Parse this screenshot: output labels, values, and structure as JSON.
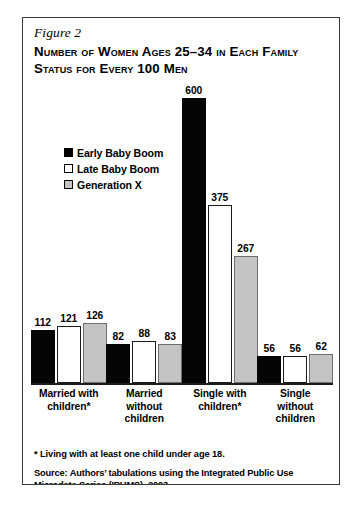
{
  "figure": {
    "label": "Figure 2",
    "title": "Number of Women Ages 25–34 in Each Family Status for Every 100 Men",
    "footnote": "* Living with at least one child under age 18.",
    "source": "Source: Authors’ tabulations using the Integrated Public Use Microdata Series (IPUMS), 2003."
  },
  "legend": {
    "items": [
      {
        "label": "Early Baby Boom",
        "swatch": "black"
      },
      {
        "label": "Late Baby Boom",
        "swatch": "white"
      },
      {
        "label": "Generation X",
        "swatch": "gray"
      }
    ]
  },
  "chart_data": {
    "type": "bar",
    "title": "Number of Women Ages 25–34 in Each Family Status for Every 100 Men",
    "xlabel": "",
    "ylabel": "",
    "ylim": [
      0,
      600
    ],
    "grid": false,
    "legend_position": "upper-left",
    "categories": [
      "Married with children*",
      "Married without children",
      "Single with children*",
      "Single without children"
    ],
    "category_lines": [
      [
        "Married with",
        "children*"
      ],
      [
        "Married",
        "without",
        "children"
      ],
      [
        "Single with",
        "children*"
      ],
      [
        "Single",
        "without",
        "children"
      ]
    ],
    "series": [
      {
        "name": "Early Baby Boom",
        "color": "#050505",
        "values": [
          112,
          82,
          600,
          56
        ]
      },
      {
        "name": "Late Baby Boom",
        "color": "#ffffff",
        "values": [
          121,
          88,
          375,
          56
        ]
      },
      {
        "name": "Generation X",
        "color": "#c4c4c4",
        "values": [
          126,
          83,
          267,
          62
        ]
      }
    ]
  }
}
